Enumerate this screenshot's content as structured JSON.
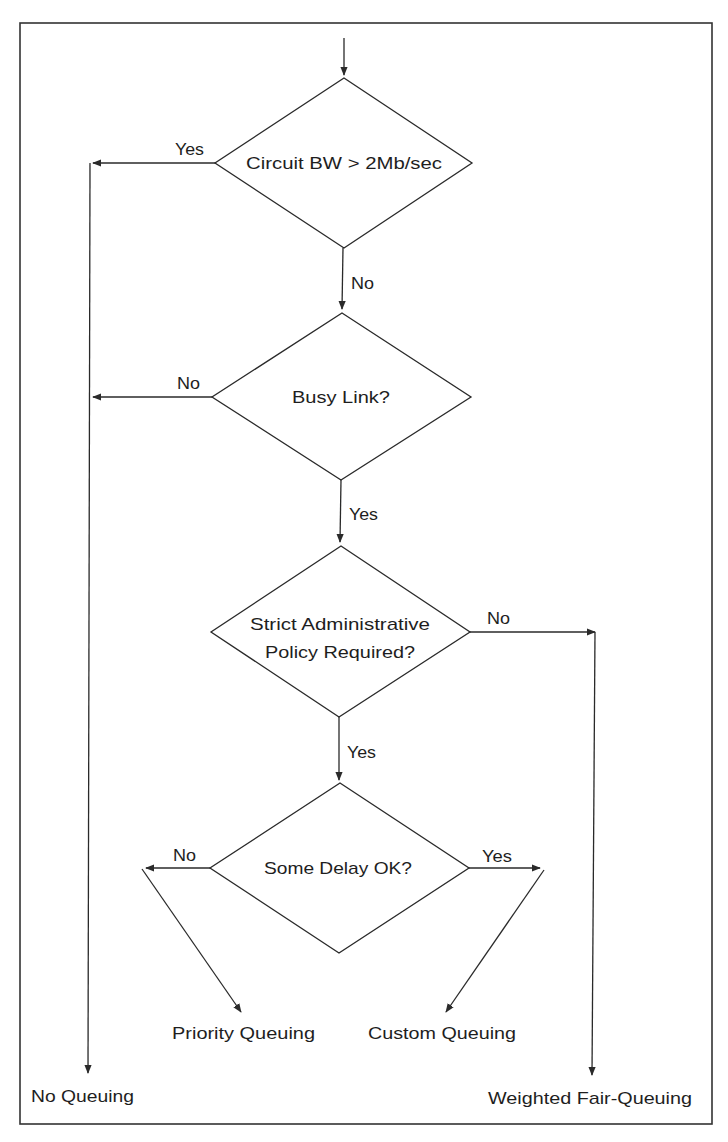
{
  "diagram": {
    "decisions": [
      {
        "id": "circuit-bw",
        "lines": [
          "Circuit BW > 2Mb/sec"
        ]
      },
      {
        "id": "busy-link",
        "lines": [
          "Busy Link?"
        ]
      },
      {
        "id": "strict-policy",
        "lines": [
          "Strict Administrative",
          "Policy Required?"
        ]
      },
      {
        "id": "some-delay",
        "lines": [
          "Some Delay OK?"
        ]
      }
    ],
    "edges": {
      "circuit_bw_yes": "Yes",
      "circuit_bw_no": "No",
      "busy_link_no": "No",
      "busy_link_yes": "Yes",
      "strict_policy_no": "No",
      "strict_policy_yes": "Yes",
      "some_delay_no": "No",
      "some_delay_yes": "Yes"
    },
    "outcomes": {
      "no_queuing": "No Queuing",
      "priority_queuing": "Priority Queuing",
      "custom_queuing": "Custom Queuing",
      "weighted_fair_queuing": "Weighted Fair-Queuing"
    },
    "colors": {
      "line": "#2a2a2a",
      "text": "#1e1e1e",
      "background": "#ffffff"
    }
  }
}
